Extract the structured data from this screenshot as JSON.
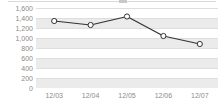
{
  "chart_data": {
    "type": "line",
    "title": "",
    "subtitle": "",
    "xlabel": "",
    "ylabel": "",
    "categories": [
      "12/03",
      "12/04",
      "12/05",
      "12/06",
      "12/07"
    ],
    "series": [
      {
        "name": "series-1",
        "values": [
          1340,
          1260,
          1430,
          1040,
          880
        ]
      }
    ],
    "ylim": [
      0,
      1600
    ],
    "yticks": [
      0,
      200,
      400,
      600,
      800,
      1000,
      1200,
      1400,
      1600
    ],
    "ytick_labels": [
      "0",
      "200",
      "400",
      "600",
      "800",
      "1,000",
      "1,200",
      "1,400",
      "1,600"
    ],
    "grid": true,
    "banded_background": true,
    "legend": false,
    "legend_position": "none",
    "marker": "open-circle",
    "colors": {
      "line": "#333333",
      "marker_fill": "#ffffff",
      "marker_stroke": "#333333",
      "grid": "#dedede",
      "band": "#ebebeb",
      "axis_text": "#8a8a8a",
      "background": "#ffffff"
    }
  }
}
